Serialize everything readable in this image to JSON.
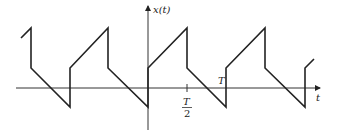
{
  "figure": {
    "type": "periodic sawtooth-like waveform",
    "y_axis_label": "x(t)",
    "x_axis_label": "t",
    "tick_labels": {
      "half_period_num": "T",
      "half_period_den": "2",
      "period": "T"
    },
    "colors": {
      "line": "#222222",
      "background": "#ffffff"
    }
  }
}
